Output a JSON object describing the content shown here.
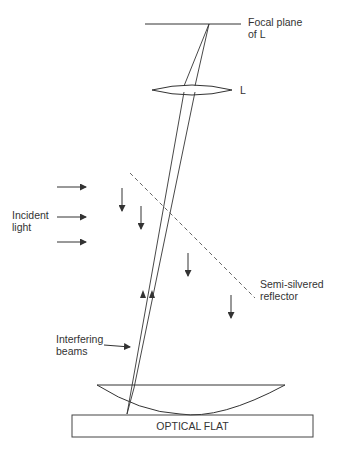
{
  "diagram": {
    "colors": {
      "stroke": "#333333",
      "background": "#ffffff"
    },
    "labels": {
      "focal_plane_line1": "Focal plane",
      "focal_plane_line2": "of L",
      "lens": "L",
      "incident_line1": "Incident",
      "incident_line2": "light",
      "reflector_line1": "Semi-silvered",
      "reflector_line2": "reflector",
      "beams_line1": "Interfering",
      "beams_line2": "beams",
      "optical_flat": "OPTICAL FLAT"
    },
    "components": [
      "focal-plane",
      "lens-L",
      "incident-light-arrows",
      "semi-silvered-reflector",
      "reflected-light-arrows",
      "interfering-beams",
      "plano-convex-lens",
      "optical-flat"
    ]
  }
}
